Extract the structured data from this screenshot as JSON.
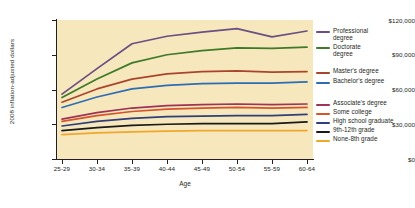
{
  "chart_data": {
    "type": "line",
    "title": "",
    "xlabel": "Age",
    "ylabel": "2008 inflation-adjusted dollars",
    "categories": [
      "25-29",
      "30-34",
      "35-39",
      "40-44",
      "45-49",
      "50-54",
      "55-59",
      "60-64"
    ],
    "ylim": [
      0,
      120000
    ],
    "ytick_values": [
      0,
      30000,
      60000,
      90000,
      120000
    ],
    "ytick_labels": [
      "$0",
      "$30,000",
      "$60,000",
      "$90,000",
      "$120,000"
    ],
    "grid": false,
    "legend_position": "right",
    "plot_background": "#f7e7bc",
    "series": [
      {
        "name": "Professional degree",
        "legend_label": "Professional\ndegree",
        "color": "#6b4f82",
        "values": [
          56000,
          78000,
          99500,
          106000,
          109500,
          112500,
          105500,
          110500
        ]
      },
      {
        "name": "Doctorate degree",
        "legend_label": "Doctorate\ndegree",
        "color": "#3d7a29",
        "values": [
          53000,
          69000,
          83000,
          90000,
          93500,
          96000,
          95500,
          96500
        ]
      },
      {
        "name": "Master's degree",
        "legend_label": "Master's degree",
        "color": "#a9452a",
        "values": [
          49000,
          60500,
          69000,
          73500,
          75500,
          76000,
          75000,
          75500
        ]
      },
      {
        "name": "Bachelor's degree",
        "legend_label": "Bachelor's degree",
        "color": "#2d6db5",
        "values": [
          44500,
          53500,
          60500,
          63500,
          65000,
          65500,
          65500,
          66500
        ]
      },
      {
        "name": "Associate's degree",
        "legend_label": "Associate's degree",
        "color": "#9e3257",
        "values": [
          34500,
          40000,
          44000,
          46000,
          47000,
          47500,
          47000,
          47500
        ]
      },
      {
        "name": "Some college",
        "legend_label": "Some college",
        "color": "#d4542b",
        "values": [
          32500,
          37500,
          41000,
          43000,
          44000,
          44500,
          44000,
          44500
        ]
      },
      {
        "name": "High school graduate",
        "legend_label": "High school graduate",
        "color": "#2f3f7a",
        "values": [
          28500,
          32500,
          35000,
          36500,
          37000,
          37500,
          37500,
          38500
        ]
      },
      {
        "name": "9th-12th grade",
        "legend_label": "9th-12th grade",
        "color": "#1a1a1a",
        "values": [
          24500,
          27000,
          29000,
          30000,
          30500,
          30500,
          30500,
          32000
        ]
      },
      {
        "name": "None-8th grade",
        "legend_label": "None-8th grade",
        "color": "#f0a72e",
        "values": [
          21000,
          22500,
          23500,
          24000,
          24500,
          24500,
          24500,
          24500
        ]
      }
    ]
  }
}
